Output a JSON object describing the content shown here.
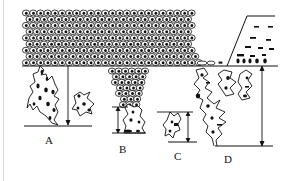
{
  "diagram": {
    "type": "histology schematic",
    "colors": {
      "ink": "#111111",
      "background": "#ffffff",
      "cell_fill": "#ffffff",
      "frame_line": "#d6d6d6"
    },
    "panels": [
      {
        "id": "A",
        "label": "A",
        "feature": "irregular tongue-like invasion below basement line with detached nest",
        "depth_arrow": true
      },
      {
        "id": "B",
        "label": "B",
        "feature": "funnel-shaped bulbous downgrowth of cells with short invasive bud",
        "depth_arrow": true
      },
      {
        "id": "C",
        "label": "C",
        "feature": "small isolated invasive nest",
        "depth_arrow": true
      },
      {
        "id": "D",
        "label": "D",
        "feature": "deep diffuse infiltrating strands beneath flattened surface",
        "depth_arrow": true
      }
    ]
  }
}
